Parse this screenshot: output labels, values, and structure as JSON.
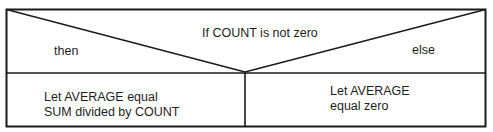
{
  "diagram": {
    "type": "nassi-shneiderman-decision",
    "condition": "If COUNT is not zero",
    "branches": {
      "then": {
        "label": "then",
        "action_lines": [
          "Let AVERAGE equal",
          "SUM divided by COUNT"
        ]
      },
      "else": {
        "label": "else",
        "action_lines": [
          "Let AVERAGE",
          "equal zero"
        ]
      }
    },
    "colors": {
      "line": "#1a1a1a",
      "text": "#1e1e1e",
      "background": "#ffffff"
    }
  }
}
